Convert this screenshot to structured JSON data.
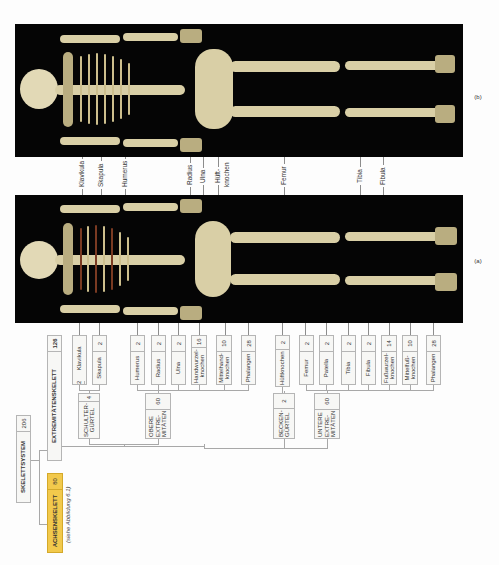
{
  "figure": {
    "panels": [
      {
        "id": "b",
        "label": "(b)",
        "view": "posterior"
      },
      {
        "id": "a",
        "label": "(a)",
        "view": "anterior"
      }
    ],
    "photo_labels": [
      "Klavikula",
      "Skapula",
      "Humerus",
      "Radius",
      "Ulna",
      "Hüftknochen",
      "Femur",
      "Tibia",
      "Fibula"
    ],
    "photo_labels_text": {
      "klavikula": "Klavikula",
      "skapula": "Skapula",
      "humerus": "Humerus",
      "radius": "Radius",
      "ulna": "Ulna",
      "hueft1": "Hüft-",
      "hueft2": "knochen",
      "femur": "Femur",
      "tibia": "Tibia",
      "fibula": "Fibula"
    }
  },
  "tree": {
    "root": {
      "label": "SKELETTSYSTEM",
      "count": "206"
    },
    "axial": {
      "label": "ACHSENSKELETT",
      "count": "80",
      "note": "(siehe Abbildung 6.1)",
      "color": "#f2c94c"
    },
    "appendicular": {
      "label": "EXTREMITÄTENSKELETT",
      "count": "126"
    },
    "groups": {
      "shoulder": {
        "label": "SCHULTER-GÜRTEL",
        "line1": "SCHULTER-",
        "line2": "GÜRTEL",
        "count": "4"
      },
      "upper": {
        "label": "OBERE EXTREMITÄTEN",
        "line1": "OBERE",
        "line2": "EXTRE-",
        "line3": "MITÄTEN",
        "count": "60"
      },
      "pelvic": {
        "label": "BECKENGÜRTEL",
        "line1": "BECKEN-",
        "line2": "GÜRTEL",
        "count": "2"
      },
      "lower": {
        "label": "UNTERE EXTREMITÄTEN",
        "line1": "UNTERE",
        "line2": "EXTRE-",
        "line3": "MITÄTEN",
        "count": "60"
      }
    },
    "bones": [
      {
        "label": "Klavikula",
        "count": "2",
        "group": "shoulder"
      },
      {
        "label": "Skapula",
        "count": "2",
        "group": "shoulder"
      },
      {
        "label": "Humerus",
        "count": "2",
        "group": "upper"
      },
      {
        "label": "Radius",
        "count": "2",
        "group": "upper"
      },
      {
        "label": "Ulna",
        "count": "2",
        "group": "upper"
      },
      {
        "label": "Handwurzel-knochen",
        "count": "16",
        "group": "upper"
      },
      {
        "label": "Mittelhand-knochen",
        "count": "10",
        "group": "upper"
      },
      {
        "label": "Phalangen",
        "count": "28",
        "group": "upper"
      },
      {
        "label": "Hüftknochen",
        "count": "2",
        "group": "pelvic"
      },
      {
        "label": "Femur",
        "count": "2",
        "group": "lower"
      },
      {
        "label": "Patella",
        "count": "2",
        "group": "lower"
      },
      {
        "label": "Tibia",
        "count": "2",
        "group": "lower"
      },
      {
        "label": "Fibula",
        "count": "2",
        "group": "lower"
      },
      {
        "label": "Fußwurzel-knochen",
        "count": "14",
        "group": "lower"
      },
      {
        "label": "Mittelfuß-knochen",
        "count": "10",
        "group": "lower"
      },
      {
        "label": "Phalangen",
        "count": "28",
        "group": "lower"
      }
    ]
  }
}
